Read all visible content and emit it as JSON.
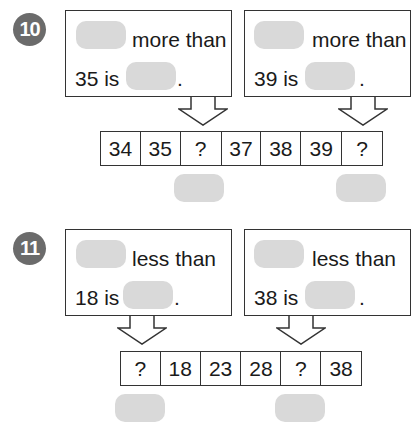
{
  "problems": [
    {
      "number": "10",
      "left_box": {
        "phrase": "more than",
        "line2_prefix": "35 is",
        "period": "."
      },
      "right_box": {
        "phrase": "more than",
        "line2_prefix": "39 is",
        "period": "."
      },
      "sequence": [
        "34",
        "35",
        "?",
        "37",
        "38",
        "39",
        "?"
      ]
    },
    {
      "number": "11",
      "left_box": {
        "phrase": "less than",
        "line2_prefix": "18 is",
        "period": "."
      },
      "right_box": {
        "phrase": "less than",
        "line2_prefix": "38 is",
        "period": "."
      },
      "sequence": [
        "?",
        "18",
        "23",
        "28",
        "?",
        "38"
      ]
    }
  ],
  "colors": {
    "badge": "#6b6b6b",
    "blank": "#d9d9d9",
    "border": "#333333"
  }
}
